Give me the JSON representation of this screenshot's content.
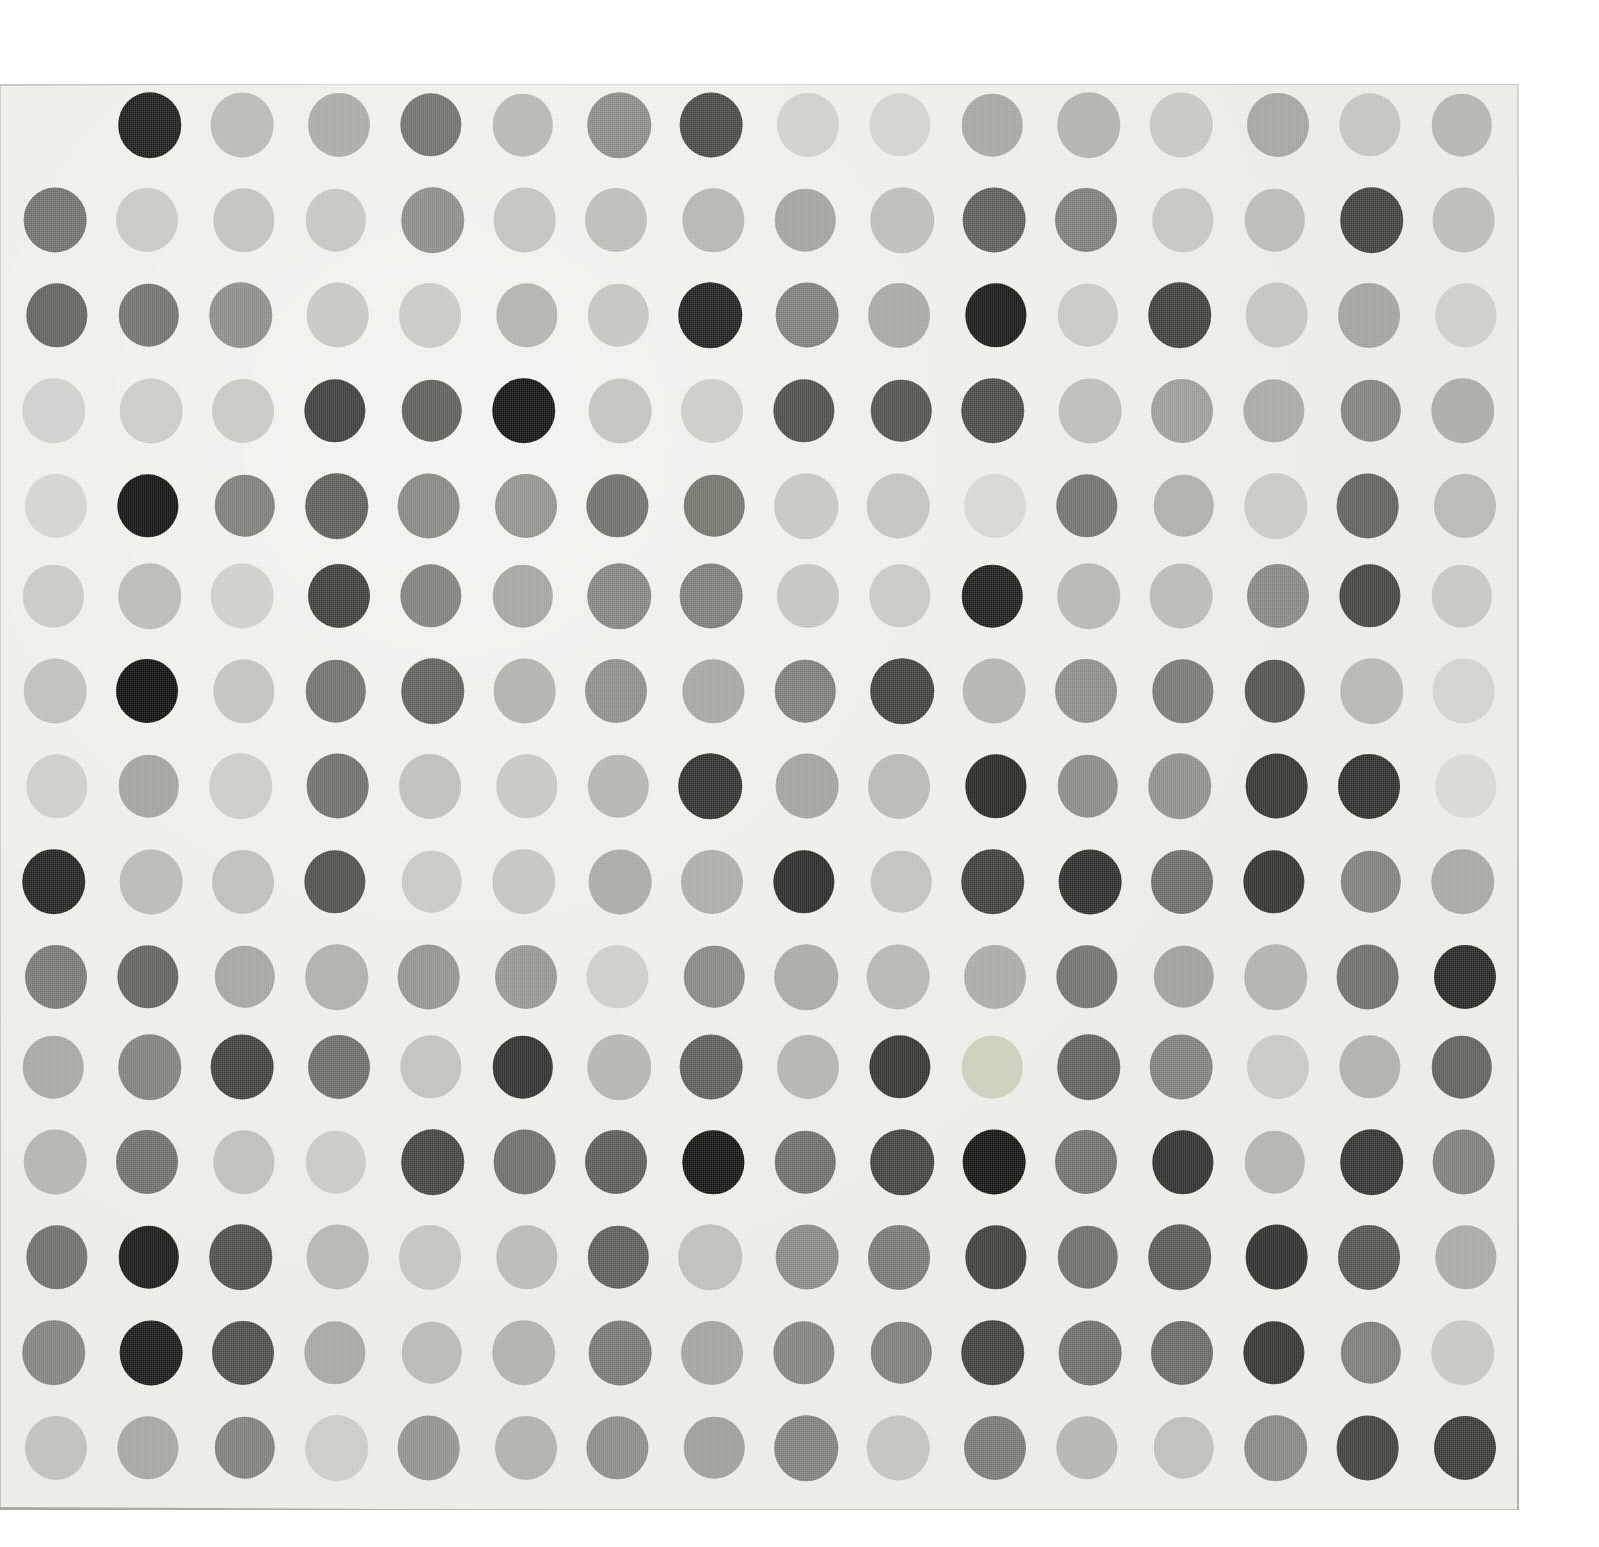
{
  "artwork": {
    "title": "Grayscale Spot Grid",
    "medium": "spot painting on canvas",
    "canvas": {
      "background_color": "#f3f2ee",
      "left": 0,
      "top": 84,
      "width": 1519,
      "height": 1426,
      "edge_color": "#b5b4af"
    },
    "page_background_color": "#ffffff"
  },
  "chart_data": {
    "type": "heatmap",
    "xlabel": "",
    "ylabel": "",
    "rows": 15,
    "columns": 16,
    "grid": {
      "first_column_center_x": 55,
      "column_step": 93.9,
      "first_row_center_y": 127,
      "row_step": 94.2,
      "dot_diameter": 62
    },
    "legend": "Each cell is a painted spot; value is the spot's fill color as hex. Null means no spot painted at that position.",
    "values": [
      [
        null,
        "#191817",
        "#b8b7b2",
        "#a9a8a3",
        "#6e6d68",
        "#b5b4af",
        "#8a8984",
        "#454441",
        "#cfcecb",
        "#d2d1ce",
        "#a4a39e",
        "#b0afaa",
        "#c6c5c1",
        "#a2a19c",
        "#c3c2be",
        "#b3b2ad"
      ],
      [
        "#6f6e69",
        "#c8c7c3",
        "#c1c0bc",
        "#c5c4c0",
        "#8b8a85",
        "#c2c1bd",
        "#bcbbb7",
        "#b4b3ae",
        "#a1a09b",
        "#bcbbb7",
        "#5a5955",
        "#7b7a75",
        "#c5c4c0",
        "#b9b8b4",
        "#3d3c39",
        "#bab9b5"
      ],
      [
        "#5f5e59",
        "#6f6e69",
        "#8b8a85",
        "#c6c5c1",
        "#c9c8c4",
        "#b1b0ab",
        "#c4c3bf",
        "#1c1b1a",
        "#7d7c77",
        "#a6a5a0",
        "#131312",
        "#c7c6c2",
        "#3b3a37",
        "#c3c2be",
        "#a09f9a",
        "#cdccc8"
      ],
      [
        "#cfcecb",
        "#cac9c5",
        "#c7c6c2",
        "#3a3936",
        "#5b5a56",
        "#0e0e0d",
        "#c2c1bd",
        "#cbcac6",
        "#4a4946",
        "#4e4d4a",
        "#47463f",
        "#bbbab6",
        "#9b9a95",
        "#a7a6a1",
        "#7f7e79",
        "#a9a8a3"
      ],
      [
        "#d3d2cf",
        "#0d0d0c",
        "#7b7a75",
        "#5b5a56",
        "#85847f",
        "#91908b",
        "#6d6c67",
        "#727168",
        "#c6c5c1",
        "#c2c1bd",
        "#d6d5d2",
        "#6f6e69",
        "#adaca7",
        "#c8c7c3",
        "#5d5c58",
        "#b6b5b0"
      ],
      [
        "#c8c7c3",
        "#b9b8b4",
        "#cecdc9",
        "#3b3a37",
        "#7e7d78",
        "#a2a19c",
        "#83827d",
        "#7a7974",
        "#c3c2be",
        "#c7c6c2",
        "#1a1918",
        "#b5b4af",
        "#b8b7b2",
        "#86857f",
        "#3f3e3b",
        "#c5c4c0"
      ],
      [
        "#bebdb9",
        "#0b0b0a",
        "#c1c0bc",
        "#6f6e69",
        "#5d5c58",
        "#b0afaa",
        "#8c8b86",
        "#a4a39e",
        "#7b7a75",
        "#3c3b38",
        "#b2b1ac",
        "#8b8a85",
        "#767570",
        "#4d4c48",
        "#b5b4af",
        "#d1d0cd"
      ],
      [
        "#cdccc8",
        "#a1a09b",
        "#cbcac6",
        "#6c6b66",
        "#bebdb9",
        "#c6c5c1",
        "#b3b2ad",
        "#2d2c2a",
        "#a09f9a",
        "#b7b6b1",
        "#23221f",
        "#888782",
        "#8e8d88",
        "#2f2e2b",
        "#2b2a28",
        "#d8d7d4"
      ],
      [
        "#1f1e1c",
        "#b8b7b2",
        "#bdbcb8",
        "#4b4a47",
        "#c7c6c2",
        "#c4c3bf",
        "#a8a7a2",
        "#aaa9a4",
        "#262523",
        "#c0bfbb",
        "#3b3a37",
        "#2a2927",
        "#6a6964",
        "#2e2d2a",
        "#7d7c77",
        "#a5a49f"
      ],
      [
        "#767570",
        "#5e5d59",
        "#a3a29d",
        "#adaca7",
        "#90918c",
        "#95948f",
        "#cdccc8",
        "#85847f",
        "#a8a7a2",
        "#b5b4af",
        "#a9a8a3",
        "#6f6e69",
        "#9d9c97",
        "#b0afaa",
        "#6b6a65",
        "#232220"
      ],
      [
        "#a5a49f",
        "#7e7d78",
        "#3d3c39",
        "#6a6964",
        "#c0bfbb",
        "#2b2a28",
        "#b3b2ad",
        "#5b5a56",
        "#b2b1ac",
        "#2f2e2b",
        "#ccccb8",
        "#5e5d59",
        "#7e7d78",
        "#c7c6c2",
        "#aeada8",
        "#5c5b57"
      ],
      [
        "#b2b1ac",
        "#6d6c67",
        "#bdbcb8",
        "#c8c7c3",
        "#403f3c",
        "#6b6a65",
        "#59585400",
        "#0f0f0e",
        "#6c6b66",
        "#3e3d3a",
        "#0f0f0e",
        "#6f6e69",
        "#2b2a28",
        "#b1b0ab",
        "#2f2e2b",
        "#7c7b76"
      ],
      [
        "#6c6b66",
        "#131312",
        "#4a4946",
        "#b4b3ae",
        "#c2c1bd",
        "#b8b7b2",
        "#5b5a56",
        "#bdbcb8",
        "#87867f",
        "#777671",
        "#3b3a37",
        "#6b6a65",
        "#56555200",
        "#2a2927",
        "#515049",
        "#a7a6a1"
      ],
      [
        "#807f7a",
        "#141413",
        "#494845",
        "#a5a49f",
        "#b7b6b1",
        "#aeada8",
        "#767570",
        "#a09f9a",
        "#807f7a",
        "#7b7a75",
        "#3c3b38",
        "#6d6c67",
        "#66655f",
        "#302f2c",
        "#7a7974",
        "#c6c5c1"
      ],
      [
        "#bebdb9",
        "#a3a29d",
        "#7c7b76",
        "#cac9c5",
        "#918f8a",
        "#aeada8",
        "#8a8984",
        "#9b9a95",
        "#7e7d78",
        "#c1c0bc",
        "#777671",
        "#b3b2ad",
        "#bdbcb8",
        "#85847f",
        "#3c3b38",
        "#36353200"
      ]
    ]
  }
}
